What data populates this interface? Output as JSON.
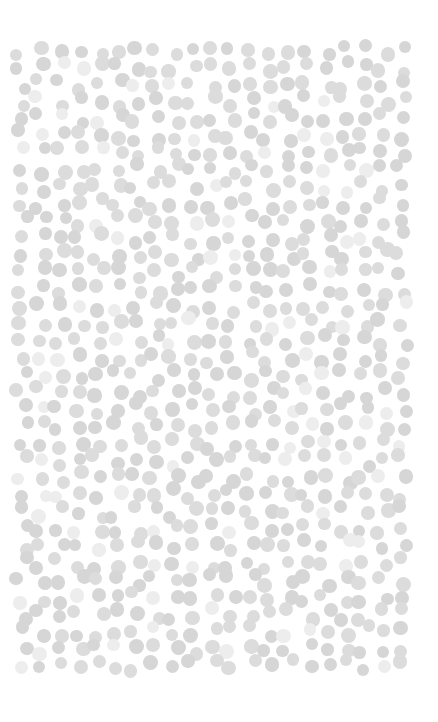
{
  "canvas": {
    "width": 438,
    "height": 722,
    "background": "#ffffff"
  },
  "pattern": {
    "type": "dot-field",
    "region": {
      "x0": 22,
      "y0": 50,
      "x1": 416,
      "y1": 680
    },
    "dot_radius_min": 6,
    "dot_radius_max": 7.5,
    "spacing": 19,
    "colors": {
      "primary": "#d6d6d6",
      "secondary": "#dcdcdc",
      "faint": "#ededed"
    },
    "faint_ratio": 0.1,
    "seed": 7
  }
}
